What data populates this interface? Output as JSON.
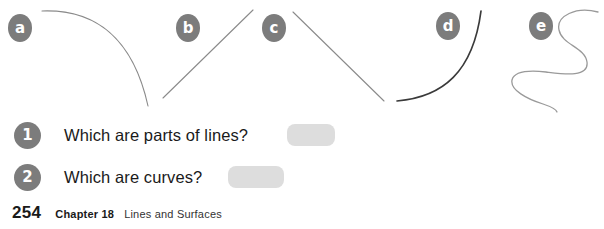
{
  "figures": {
    "stroke_color_light": "#8a8a8a",
    "stroke_color_dark": "#3a3a3a",
    "label_bg": "#7c7c7c",
    "label_fg": "#ffffff",
    "items": [
      {
        "label": "a",
        "shape": "arc-curve",
        "x": 8,
        "y": 14
      },
      {
        "label": "b",
        "shape": "straight-line-segment",
        "x": 176,
        "y": 14
      },
      {
        "label": "c",
        "shape": "straight-line-segment",
        "x": 262,
        "y": 14
      },
      {
        "label": "d",
        "shape": "arc-curve",
        "x": 436,
        "y": 12
      },
      {
        "label": "e",
        "shape": "wavy-squiggle",
        "x": 529,
        "y": 12
      }
    ]
  },
  "questions": {
    "answer_box_color": "#dddddd",
    "badge_color": "#7c7c7c",
    "items": [
      {
        "number": "1",
        "text": "Which are parts of lines?",
        "answer": "",
        "box_left": 287,
        "box_width": 48
      },
      {
        "number": "2",
        "text": "Which are curves?",
        "answer": "",
        "box_left": 228,
        "box_width": 56
      }
    ]
  },
  "footer": {
    "page_number": "254",
    "chapter": "Chapter 18",
    "title": "Lines and Surfaces"
  }
}
